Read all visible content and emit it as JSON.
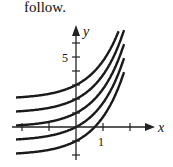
{
  "caption": "follow.",
  "chart_data": {
    "type": "line",
    "title": "",
    "xlabel": "x",
    "ylabel": "y",
    "x_ticks": [
      {
        "value": 1,
        "label": "1"
      }
    ],
    "y_ticks": [
      {
        "value": 5,
        "label": "5"
      }
    ],
    "xlim": [
      -2.2,
      2.4
    ],
    "ylim": [
      -2.5,
      7
    ],
    "grid": false,
    "series": [
      {
        "name": "C=2",
        "C": 2
      },
      {
        "name": "C=1",
        "C": 1
      },
      {
        "name": "C=0",
        "C": 0
      },
      {
        "name": "C=-1",
        "C": -1
      },
      {
        "name": "C=-2",
        "C": -2
      }
    ]
  }
}
